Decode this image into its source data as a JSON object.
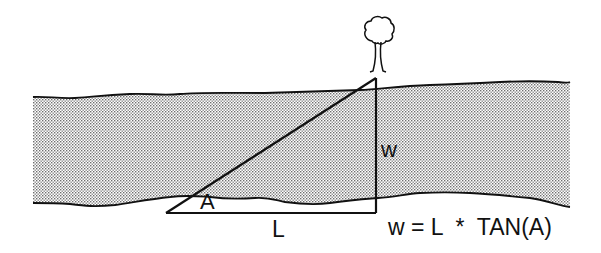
{
  "diagram": {
    "labels": {
      "angle": "A",
      "baseline": "L",
      "width": "w",
      "formula": "w = L  *  TAN(A)"
    },
    "elements": [
      "tree",
      "river",
      "right-triangle"
    ],
    "colors": {
      "stroke": "#111111",
      "river_dot": "#6e6e6e",
      "background": "#ffffff"
    }
  }
}
